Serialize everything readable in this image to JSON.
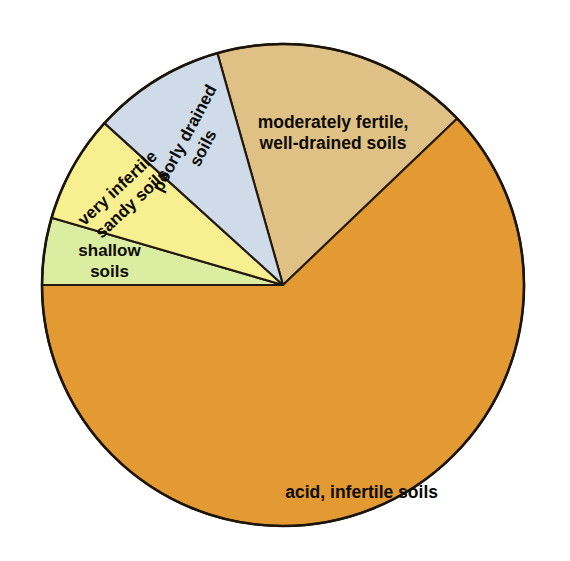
{
  "figure": {
    "title": "",
    "background_color": "#ffffff",
    "outline_color": "#1c150c"
  },
  "chart_data": {
    "type": "pie",
    "title": "",
    "xlabel": "",
    "ylabel": "",
    "legend_position": "none",
    "grid": false,
    "start_angle_deg": -15.8,
    "direction": "clockwise",
    "categories": [
      "moderately fertile, well-drained soils",
      "acid, infertile soils",
      "shallow soils",
      "very infertile sandy soils",
      "poorly drained soils"
    ],
    "values": [
      17.2,
      62.1,
      4.5,
      7.2,
      9.0
    ],
    "units": "percent",
    "slices": [
      {
        "label": "moderately fertile, well-drained soils",
        "label_lines": [
          "moderately fertile,",
          "well-drained soils"
        ],
        "value": 17.2,
        "angle_deg": 62.1,
        "start_deg": -15.8,
        "end_deg": 46.3,
        "color": "#e0c185",
        "label_rotation_deg": 0
      },
      {
        "label": "acid, infertile soils",
        "label_lines": [
          "acid, infertile soils"
        ],
        "value": 62.1,
        "angle_deg": 223.7,
        "start_deg": 46.3,
        "end_deg": 270.0,
        "color": "#e39a32",
        "label_rotation_deg": 0
      },
      {
        "label": "shallow soils",
        "label_lines": [
          "shallow",
          "soils"
        ],
        "value": 4.5,
        "angle_deg": 16.2,
        "start_deg": 270.0,
        "end_deg": 286.2,
        "color": "#dbeda0",
        "label_rotation_deg": 0
      },
      {
        "label": "very infertile sandy soils",
        "label_lines": [
          "very infertile",
          "sandy soils"
        ],
        "value": 7.2,
        "angle_deg": 26.0,
        "start_deg": 286.2,
        "end_deg": 312.2,
        "color": "#f8ef90",
        "label_rotation_deg": -43
      },
      {
        "label": "poorly drained soils",
        "label_lines": [
          "poorly drained",
          "soils"
        ],
        "value": 9.0,
        "angle_deg": 32.4,
        "start_deg": 312.2,
        "end_deg": 344.2,
        "color": "#cfdbe8",
        "label_rotation_deg": -62
      }
    ],
    "geometry": {
      "center_x": 283,
      "center_y": 285,
      "radius": 241
    }
  }
}
